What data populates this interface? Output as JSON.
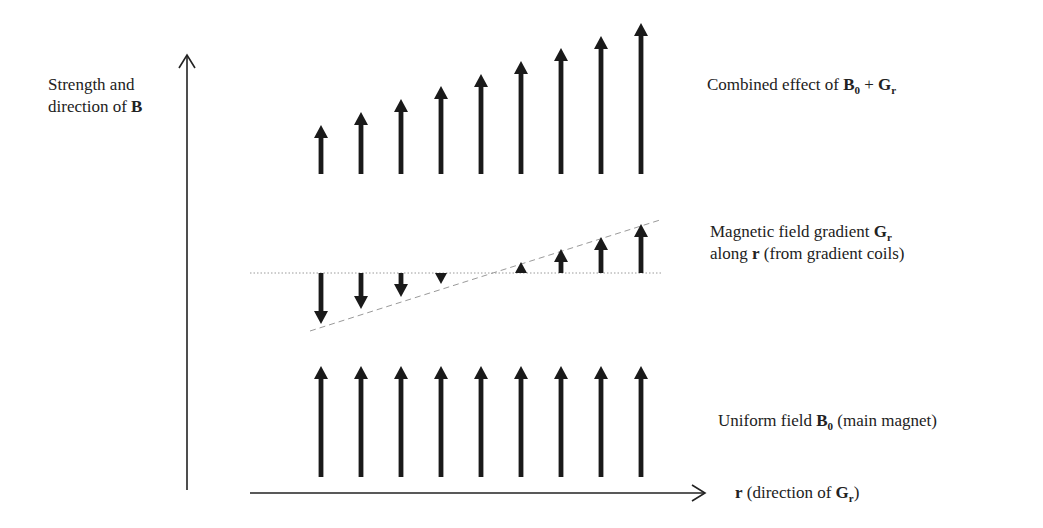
{
  "diagram": {
    "type": "vector-field-illustration",
    "y_axis": {
      "label_line1": "Strength and",
      "label_line2_text": "direction of ",
      "label_line2_bold": "B",
      "x": 187,
      "y_top": 55,
      "y_bottom": 490
    },
    "x_axis": {
      "label_bold": "r",
      "label_text": " (direction of ",
      "label_bold2": "G",
      "label_sub": "r",
      "label_close": ")",
      "y": 493,
      "x_start": 250,
      "x_end": 705
    },
    "columns_x": [
      321,
      361,
      401,
      441,
      481,
      521,
      561,
      601,
      641
    ],
    "rows": [
      {
        "name": "combined",
        "label_text": "Combined effect of ",
        "label_b": "B",
        "label_b_sub": "0",
        "label_plus": " + ",
        "label_g": "G",
        "label_g_sub": "r",
        "base_y": 174,
        "tip_y": [
          125,
          112,
          99,
          86,
          74,
          61,
          48,
          36,
          23
        ]
      },
      {
        "name": "gradient",
        "label_line1_text": "Magnetic field gradient ",
        "label_line1_g": "G",
        "label_line1_sub": "r",
        "label_line2_text": "along ",
        "label_line2_bold": "r",
        "label_line2_rest": " (from gradient coils)",
        "zero_y": 273,
        "zero_line": {
          "x1": 250,
          "x2": 662
        },
        "gradient_line": {
          "x1": 310,
          "y1": 331,
          "x2": 660,
          "y2": 220
        },
        "tip_y": [
          324,
          309,
          297,
          284,
          null,
          262,
          249,
          237,
          224
        ]
      },
      {
        "name": "uniform",
        "label_text": "Uniform field ",
        "label_b": "B",
        "label_b_sub": "0",
        "label_rest": " (main magnet)",
        "base_y": 477,
        "tip_y": [
          366,
          366,
          366,
          366,
          366,
          366,
          366,
          366,
          366
        ]
      }
    ],
    "colors": {
      "arrow": "#1a1a1a",
      "axis": "#222222",
      "guide": "#9a9a9a"
    }
  }
}
